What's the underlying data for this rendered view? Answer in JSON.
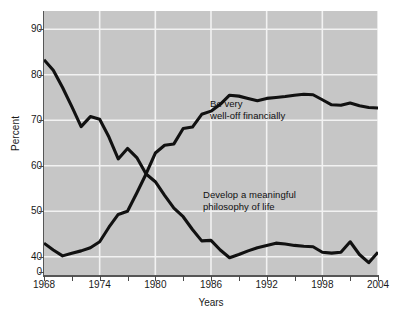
{
  "chart_data": {
    "type": "line",
    "title": "",
    "xlabel": "Years",
    "ylabel": "Percent",
    "xlim": [
      1968,
      2004
    ],
    "ylim": [
      36,
      94
    ],
    "grid": true,
    "legend_position": "inline-annotations",
    "axis_break": "y-axis broken between 40 and 0",
    "x": [
      1968,
      1969,
      1970,
      1971,
      1972,
      1973,
      1974,
      1975,
      1976,
      1977,
      1978,
      1979,
      1980,
      1981,
      1982,
      1983,
      1984,
      1985,
      1986,
      1987,
      1988,
      1989,
      1990,
      1991,
      1992,
      1993,
      1994,
      1995,
      1996,
      1997,
      1998,
      1999,
      2000,
      2001,
      2002,
      2003,
      2004
    ],
    "xticks": [
      1968,
      1974,
      1980,
      1986,
      1992,
      1998,
      2004
    ],
    "xtick_labels": [
      "1968",
      "1974",
      "1980",
      "1986",
      "1992",
      "1998",
      "2004"
    ],
    "xminor_ticks": [
      1971,
      1977,
      1983,
      1989,
      1995,
      2001
    ],
    "yticks": [
      40,
      50,
      60,
      70,
      80,
      90
    ],
    "ytick_labels": [
      "40",
      "50",
      "60",
      "70",
      "80",
      "90"
    ],
    "yzero_label": "0",
    "series": [
      {
        "name": "Be very well-off financially",
        "color": "#111111",
        "annotation": "Be very\nwell-off financially",
        "values": [
          43.0,
          41.5,
          40.2,
          40.8,
          41.3,
          42.0,
          43.3,
          46.5,
          49.3,
          50.0,
          54.0,
          58.2,
          62.8,
          64.5,
          64.8,
          68.2,
          68.5,
          71.3,
          72.0,
          73.5,
          75.5,
          75.3,
          74.8,
          74.3,
          74.8,
          75.0,
          75.2,
          75.5,
          75.7,
          75.6,
          74.5,
          73.4,
          73.3,
          73.8,
          73.2,
          72.8,
          72.7
        ]
      },
      {
        "name": "Develop a meaningful philosophy of life",
        "color": "#111111",
        "annotation": "Develop a meaningful\nphilosophy of life",
        "values": [
          83.3,
          81.0,
          77.2,
          73.0,
          68.6,
          70.8,
          70.2,
          66.3,
          61.5,
          63.8,
          61.8,
          58.2,
          56.5,
          53.5,
          50.7,
          48.8,
          46.0,
          43.5,
          43.6,
          41.5,
          39.8,
          40.5,
          41.3,
          42.0,
          42.5,
          43.0,
          42.8,
          42.5,
          42.3,
          42.2,
          41.0,
          40.8,
          41.0,
          43.3,
          40.5,
          38.7,
          41.0
        ]
      }
    ]
  }
}
